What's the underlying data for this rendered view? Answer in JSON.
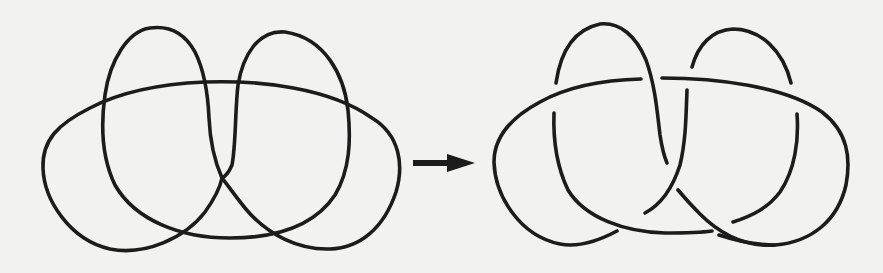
{
  "figure": {
    "left_panel": {
      "label": "knot projection",
      "crossings": 7
    },
    "arrow": {
      "direction": "right"
    },
    "right_panel": {
      "label": "knot diagram with crossings",
      "crossings": 7
    },
    "colors": {
      "background": "#f2f2f0",
      "stroke": "#1c1c1c"
    }
  }
}
